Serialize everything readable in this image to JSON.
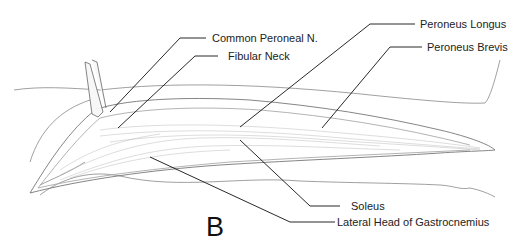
{
  "figure": {
    "panel_letter": "B",
    "labels": {
      "common_peroneal_n": "Common Peroneal N.",
      "fibular_neck": "Fibular Neck",
      "peroneus_longus": "Peroneus Longus",
      "peroneus_brevis": "Peroneus Brevis",
      "soleus": "Soleus",
      "lateral_head_gastrocnemius": "Lateral Head of Gastrocnemius"
    }
  }
}
